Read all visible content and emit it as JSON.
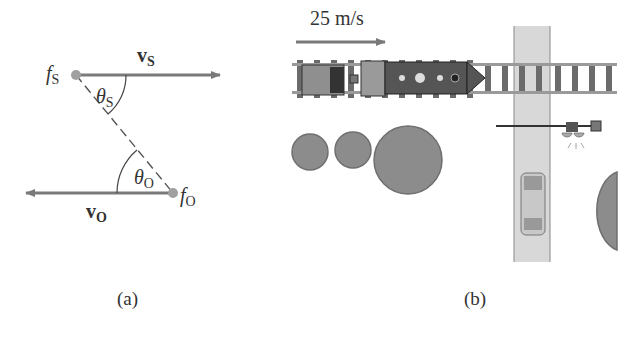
{
  "panel_a": {
    "caption": "(a)",
    "source": {
      "label": "f",
      "sub": "S",
      "velocity_label": "v",
      "velocity_sub": "S",
      "angle_label": "θ",
      "angle_sub": "S"
    },
    "observer": {
      "label": "f",
      "sub": "O",
      "velocity_label": "v",
      "velocity_sub": "O",
      "angle_label": "θ",
      "angle_sub": "O"
    }
  },
  "panel_b": {
    "caption": "(b)",
    "speed_label": "25 m/s",
    "elements": [
      "train",
      "railroad-track",
      "road",
      "crossing-gate",
      "warning-light",
      "car",
      "trees"
    ]
  },
  "colors": {
    "arrow": "#7a7a7a",
    "dot": "#a0a0a0",
    "train_dark": "#555555",
    "train_light": "#8f8f8f",
    "road": "#d6d6d6",
    "tree": "#8c8c8c"
  }
}
